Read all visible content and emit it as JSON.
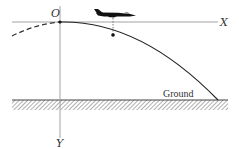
{
  "diagram": {
    "labels": {
      "origin": "O",
      "x_axis": "X",
      "y_axis": "Y",
      "ground": "Ground"
    },
    "elements": {
      "x_axis": {
        "x1": 12,
        "y1": 22,
        "x2": 218,
        "y2": 22
      },
      "y_axis": {
        "x1": 60,
        "y1": 5,
        "x2": 60,
        "y2": 138
      },
      "origin_point": {
        "x": 60,
        "y": 22
      },
      "ground_line": {
        "x1": 12,
        "y1": 100,
        "x2": 228,
        "y2": 100
      },
      "marker_point": {
        "x": 113,
        "y": 35
      },
      "drop_line": {
        "x1": 113,
        "y1": 22,
        "x2": 113,
        "y2": 35
      }
    },
    "colors": {
      "axis": "#888888",
      "curve": "#222222",
      "ground": "#444444",
      "hatch": "#888888",
      "aircraft": "#111111",
      "text": "#333333"
    }
  }
}
